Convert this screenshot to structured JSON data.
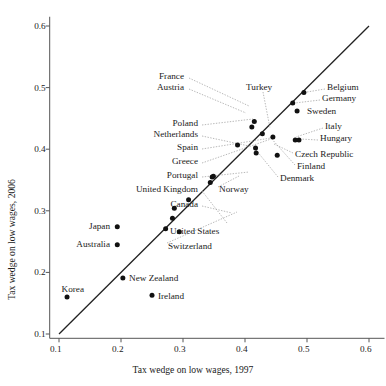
{
  "chart_data": {
    "type": "scatter",
    "title": "",
    "xlabel": "Tax wedge on low wages, 1997",
    "ylabel": "Tax wedge on low wages, 2006",
    "xlim": [
      0.085,
      0.625
    ],
    "ylim": [
      0.093,
      0.615
    ],
    "xticks": [
      0.1,
      0.2,
      0.3,
      0.4,
      0.5,
      0.6
    ],
    "xtick_labels": [
      "0.1",
      "0.2",
      "0.3",
      "0.4",
      "0.5",
      "0.6"
    ],
    "yticks": [
      0.1,
      0.2,
      0.3,
      0.4,
      0.5,
      0.6
    ],
    "ytick_labels": [
      "0.1",
      "0.2",
      "0.3",
      "0.4",
      "0.5",
      "0.6"
    ],
    "grid": false,
    "legend": false,
    "reference_line": {
      "name": "45-degree-line",
      "from": [
        0.1,
        0.1
      ],
      "to": [
        0.6,
        0.6
      ]
    },
    "points": [
      {
        "label": "Korea",
        "x": 0.113,
        "y": 0.16
      },
      {
        "label": "Japan",
        "x": 0.194,
        "y": 0.274
      },
      {
        "label": "Australia",
        "x": 0.194,
        "y": 0.245
      },
      {
        "label": "New Zealand",
        "x": 0.203,
        "y": 0.191
      },
      {
        "label": "Ireland",
        "x": 0.25,
        "y": 0.163
      },
      {
        "label": "United Kingdom",
        "x": 0.272,
        "y": 0.271
      },
      {
        "label": "Canada",
        "x": 0.283,
        "y": 0.288
      },
      {
        "label": "Switzerland",
        "x": 0.286,
        "y": 0.304
      },
      {
        "label": "United States",
        "x": 0.294,
        "y": 0.266
      },
      {
        "label": "Portugal",
        "x": 0.309,
        "y": 0.318
      },
      {
        "label": "Greece",
        "x": 0.344,
        "y": 0.346
      },
      {
        "label": "Spain",
        "x": 0.347,
        "y": 0.355
      },
      {
        "label": "Norway",
        "x": 0.349,
        "y": 0.356
      },
      {
        "label": "Netherlands",
        "x": 0.388,
        "y": 0.407
      },
      {
        "label": "Austria",
        "x": 0.411,
        "y": 0.436
      },
      {
        "label": "France",
        "x": 0.415,
        "y": 0.445
      },
      {
        "label": "Poland",
        "x": 0.417,
        "y": 0.402
      },
      {
        "label": "Denmark",
        "x": 0.418,
        "y": 0.394
      },
      {
        "label": "Turkey",
        "x": 0.428,
        "y": 0.425
      },
      {
        "label": "Finland",
        "x": 0.445,
        "y": 0.42
      },
      {
        "label": "Czech Republic",
        "x": 0.452,
        "y": 0.39
      },
      {
        "label": "Germany",
        "x": 0.477,
        "y": 0.475
      },
      {
        "label": "Italy",
        "x": 0.481,
        "y": 0.415
      },
      {
        "label": "Hungary",
        "x": 0.487,
        "y": 0.415
      },
      {
        "label": "Sweden",
        "x": 0.484,
        "y": 0.462
      },
      {
        "label": "Belgium",
        "x": 0.495,
        "y": 0.492
      }
    ],
    "annotations": [
      {
        "label": "France",
        "lx": 184,
        "ly": 77,
        "align": "right",
        "leader": [
          [
            189,
            78
          ],
          [
            249,
            106
          ]
        ]
      },
      {
        "label": "Austria",
        "lx": 184,
        "ly": 88,
        "align": "right",
        "leader": [
          [
            189,
            89
          ],
          [
            246,
            113
          ]
        ]
      },
      {
        "label": "Turkey",
        "lx": 246,
        "ly": 88,
        "align": "left",
        "leader": [
          [
            263,
            92
          ],
          [
            270,
            128
          ]
        ]
      },
      {
        "label": "Poland",
        "lx": 198,
        "ly": 124,
        "align": "right",
        "leader": [
          [
            202,
            125
          ],
          [
            253,
            119
          ]
        ]
      },
      {
        "label": "Netherlands",
        "lx": 198,
        "ly": 135,
        "align": "right",
        "leader": [
          [
            202,
            136
          ],
          [
            249,
            146
          ]
        ]
      },
      {
        "label": "Spain",
        "lx": 198,
        "ly": 148,
        "align": "right",
        "leader": [
          [
            202,
            149
          ],
          [
            271,
            138
          ]
        ]
      },
      {
        "label": "Greece",
        "lx": 198,
        "ly": 162,
        "align": "right",
        "leader": [
          [
            202,
            163
          ],
          [
            271,
            139
          ]
        ]
      },
      {
        "label": "Portugal",
        "lx": 198,
        "ly": 176,
        "align": "right",
        "leader": [
          [
            202,
            177
          ],
          [
            249,
            172
          ]
        ]
      },
      {
        "label": "United Kingdom",
        "lx": 198,
        "ly": 190,
        "align": "right",
        "leader": [
          [
            202,
            191
          ],
          [
            227,
            223
          ]
        ]
      },
      {
        "label": "Canada",
        "lx": 198,
        "ly": 205,
        "align": "right",
        "leader": [
          [
            202,
            206
          ],
          [
            232,
            213
          ]
        ]
      },
      {
        "label": "Japan",
        "lx": 110,
        "ly": 227,
        "align": "right",
        "leader": null
      },
      {
        "label": "Australia",
        "lx": 110,
        "ly": 245,
        "align": "right",
        "leader": null
      },
      {
        "label": "Korea",
        "lx": 84,
        "ly": 290,
        "align": "right",
        "leader": null
      },
      {
        "label": "New Zealand",
        "lx": 129,
        "ly": 279,
        "align": "left",
        "leader": null
      },
      {
        "label": "Ireland",
        "lx": 158,
        "ly": 297,
        "align": "left",
        "leader": null
      },
      {
        "label": "United States",
        "lx": 170,
        "ly": 232,
        "align": "left",
        "leader": null
      },
      {
        "label": "Switzerland",
        "lx": 168,
        "ly": 247,
        "align": "left",
        "leader": [
          [
            167,
            243
          ],
          [
            237,
            212
          ]
        ]
      },
      {
        "label": "Norway",
        "lx": 219,
        "ly": 190,
        "align": "left",
        "leader": [
          [
            218,
            187
          ],
          [
            239,
            176
          ]
        ]
      },
      {
        "label": "Belgium",
        "lx": 327,
        "ly": 88,
        "align": "left",
        "leader": [
          [
            325,
            89
          ],
          [
            307,
            92
          ]
        ]
      },
      {
        "label": "Germany",
        "lx": 322,
        "ly": 99,
        "align": "left",
        "leader": [
          [
            320,
            100
          ],
          [
            295,
            103
          ]
        ]
      },
      {
        "label": "Sweden",
        "lx": 307,
        "ly": 112,
        "align": "left",
        "leader": null
      },
      {
        "label": "Italy",
        "lx": 325,
        "ly": 127,
        "align": "left",
        "leader": [
          [
            323,
            128
          ],
          [
            296,
            137
          ]
        ]
      },
      {
        "label": "Hungary",
        "lx": 320,
        "ly": 139,
        "align": "left",
        "leader": [
          [
            318,
            140
          ],
          [
            300,
            139
          ]
        ]
      },
      {
        "label": "Czech Republic",
        "lx": 295,
        "ly": 155,
        "align": "left",
        "leader": [
          [
            293,
            153
          ],
          [
            274,
            144
          ]
        ]
      },
      {
        "label": "Finland",
        "lx": 297,
        "ly": 167,
        "align": "left",
        "leader": [
          [
            295,
            165
          ],
          [
            270,
            137
          ]
        ]
      },
      {
        "label": "Denmark",
        "lx": 280,
        "ly": 179,
        "align": "left",
        "leader": [
          [
            278,
            177
          ],
          [
            256,
            150
          ]
        ]
      }
    ]
  },
  "axes": {
    "x_title": "Tax wedge on low wages, 1997",
    "y_title": "Tax wedge on low wages, 2006"
  }
}
